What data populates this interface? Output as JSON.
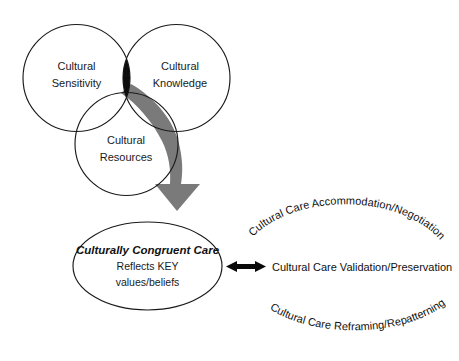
{
  "diagram": {
    "background_color": "#ffffff",
    "outline_color": "#1a1a1a",
    "arrow_gray": "#7a7a7a",
    "lens_color": "#0d0d0d"
  },
  "venn": {
    "circles": [
      {
        "id": "sensitivity",
        "label_line1": "Cultural",
        "label_line2": "Sensitivity"
      },
      {
        "id": "knowledge",
        "label_line1": "Cultural",
        "label_line2": "Knowledge"
      },
      {
        "id": "resources",
        "label_line1": "Cultural",
        "label_line2": "Resources"
      }
    ]
  },
  "core": {
    "title": "Culturally Congruent Care",
    "line2": "Reflects KEY",
    "line3": "values/beliefs"
  },
  "modes": {
    "arc_top": "Cultural Care Accommodation/Negotiation",
    "straight_middle": "Cultural Care Validation/Preservation",
    "arc_bottom": "Cultural Care Reframing/Repatterning"
  }
}
